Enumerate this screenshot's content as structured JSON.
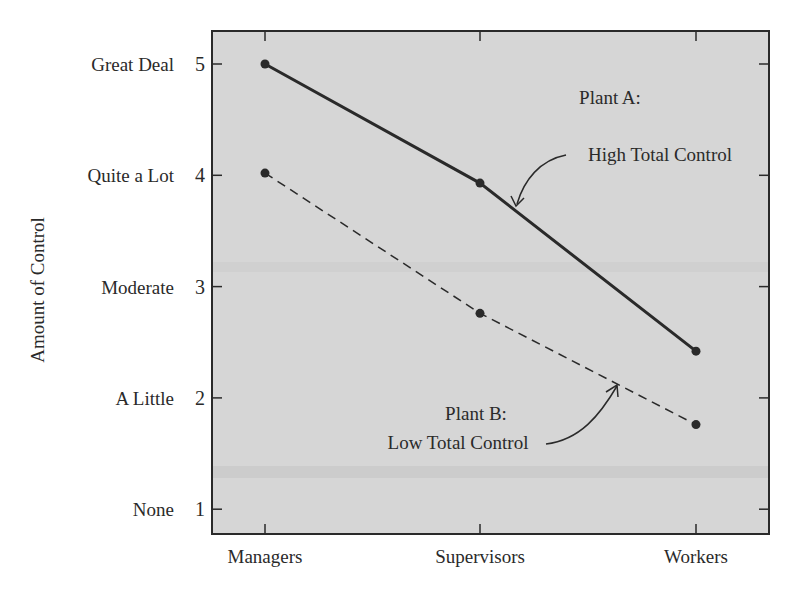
{
  "chart_data": {
    "type": "line",
    "title": "",
    "xlabel": "",
    "ylabel": "Amount of Control",
    "categories": [
      "Managers",
      "Supervisors",
      "Workers"
    ],
    "y_ticks": [
      1,
      2,
      3,
      4,
      5
    ],
    "y_tick_labels": [
      "None",
      "A Little",
      "Moderate",
      "Quite a Lot",
      "Great Deal"
    ],
    "ylim": [
      0.78,
      5.3
    ],
    "grid": false,
    "series": [
      {
        "name": "Plant A: High Total Control",
        "style": "solid",
        "values": [
          5.0,
          3.93,
          2.42
        ]
      },
      {
        "name": "Plant B: Low Total Control",
        "style": "dashed",
        "values": [
          4.02,
          2.76,
          1.76
        ]
      }
    ],
    "annotations": [
      {
        "line1": "Plant A:",
        "line2": "High Total Control"
      },
      {
        "line1": "Plant B:",
        "line2": "Low Total Control"
      }
    ],
    "colors": {
      "plot_bg": "#d4d4d4",
      "line": "#2a2a2a"
    }
  }
}
